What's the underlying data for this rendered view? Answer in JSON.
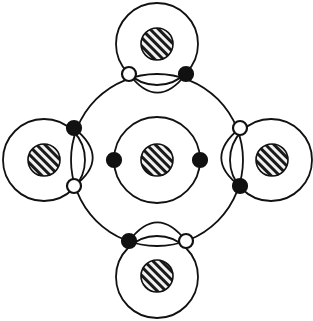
{
  "figure": {
    "background_color": "#ffffff",
    "stroke_color": "#111111",
    "solid_node_color": "#111111",
    "hollow_node_fill": "#ffffff",
    "hatch_fill_color": "#efefef",
    "hatch_line_color": "#1a1a1a",
    "canvas": {
      "width": 313,
      "height": 321
    }
  },
  "geometry": {
    "center": {
      "cx": 157,
      "cy": 160
    },
    "outer_ring": {
      "cx": 157,
      "cy": 160,
      "r": 86,
      "stroke_width": 1.8
    },
    "inner_circle": {
      "cx": 157,
      "cy": 160,
      "r": 43,
      "stroke_width": 1.8
    },
    "satellite_radius": 41,
    "satellites": [
      {
        "id": "north",
        "label": "top-satellite",
        "cx": 157,
        "cy": 44,
        "lens_bulge": 17
      },
      {
        "id": "east",
        "label": "right-satellite",
        "cx": 271,
        "cy": 160,
        "lens_bulge": 17
      },
      {
        "id": "south",
        "label": "bottom-satellite",
        "cx": 157,
        "cy": 277,
        "lens_bulge": 17
      },
      {
        "id": "west",
        "label": "left-satellite",
        "cx": 44,
        "cy": 160,
        "lens_bulge": 17
      }
    ],
    "hatched_disks": [
      {
        "id": "center-disk",
        "cx": 157,
        "cy": 160,
        "r": 16
      },
      {
        "id": "north-disk",
        "cx": 157,
        "cy": 44,
        "r": 16
      },
      {
        "id": "east-disk",
        "cx": 272,
        "cy": 160,
        "r": 16
      },
      {
        "id": "south-disk",
        "cx": 157,
        "cy": 276,
        "r": 16
      },
      {
        "id": "west-disk",
        "cx": 44,
        "cy": 160,
        "r": 16
      }
    ],
    "node_radius_solid": 7,
    "node_radius_hollow": 7,
    "nodes": [
      {
        "id": "n1",
        "name": "node-top-left",
        "type": "hollow",
        "cx": 129,
        "cy": 74
      },
      {
        "id": "n2",
        "name": "node-top-right",
        "type": "solid",
        "cx": 186,
        "cy": 74
      },
      {
        "id": "n3",
        "name": "node-right-top",
        "type": "hollow",
        "cx": 240,
        "cy": 128
      },
      {
        "id": "n4",
        "name": "node-right-bottom",
        "type": "solid",
        "cx": 240,
        "cy": 186
      },
      {
        "id": "n5",
        "name": "node-bottom-right",
        "type": "hollow",
        "cx": 186,
        "cy": 241
      },
      {
        "id": "n6",
        "name": "node-bottom-left",
        "type": "solid",
        "cx": 129,
        "cy": 241
      },
      {
        "id": "n7",
        "name": "node-left-bottom",
        "type": "hollow",
        "cx": 74,
        "cy": 186
      },
      {
        "id": "n8",
        "name": "node-left-top",
        "type": "solid",
        "cx": 74,
        "cy": 128
      },
      {
        "id": "n9",
        "name": "node-center-left",
        "type": "solid",
        "cx": 114,
        "cy": 160
      },
      {
        "id": "n10",
        "name": "node-center-right",
        "type": "solid",
        "cx": 200,
        "cy": 160
      }
    ],
    "lenses": [
      {
        "id": "lens-north",
        "from": "n1",
        "to": "n2",
        "orientation": "horizontal",
        "bulge": 17
      },
      {
        "id": "lens-east",
        "from": "n3",
        "to": "n4",
        "orientation": "vertical",
        "bulge": 17
      },
      {
        "id": "lens-south",
        "from": "n6",
        "to": "n5",
        "orientation": "horizontal",
        "bulge": 17
      },
      {
        "id": "lens-west",
        "from": "n8",
        "to": "n7",
        "orientation": "vertical",
        "bulge": 17
      }
    ],
    "counts": {
      "solid_nodes": 6,
      "hollow_nodes": 4,
      "hatched_disks": 5,
      "satellite_circles": 4,
      "rings": 2
    }
  }
}
